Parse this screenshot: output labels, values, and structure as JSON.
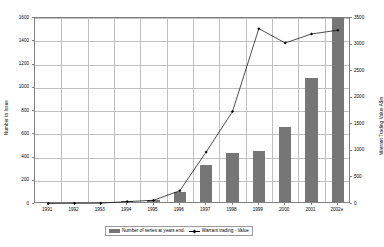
{
  "chart_data": {
    "type": "bar",
    "title": "",
    "subtitle": "",
    "xlabel": "",
    "ylabel": "Number in Issue",
    "y2label": "Warrant Trading Value A$m",
    "categories": [
      "1991",
      "1992",
      "1993",
      "1994",
      "1995",
      "1996",
      "1997",
      "1998",
      "1999",
      "2000",
      "2001",
      "2002e"
    ],
    "grid": true,
    "legend_position": "bottom",
    "ylim": [
      0,
      1600
    ],
    "y2lim": [
      0,
      3500
    ],
    "yticks": [
      "0",
      "200",
      "400",
      "600",
      "800",
      "1000",
      "1200",
      "1400",
      "1600"
    ],
    "y2ticks": [
      "0",
      "500",
      "1000",
      "1500",
      "2000",
      "2500",
      "3000",
      "3500"
    ],
    "series": [
      {
        "name": "Number of series  at years end.",
        "type": "bar",
        "axis": "left",
        "color": "#767676",
        "values": [
          2,
          2,
          3,
          8,
          18,
          85,
          315,
          420,
          435,
          645,
          1065,
          1590
        ]
      },
      {
        "name": "Warrant trading  - Value",
        "type": "line",
        "axis": "right",
        "color": "#000000",
        "marker": "diamond",
        "values": [
          10,
          12,
          15,
          45,
          70,
          250,
          980,
          1740,
          3300,
          3030,
          3200,
          3270
        ]
      }
    ]
  },
  "legend": {
    "items": [
      {
        "label": "Number of series  at years end.",
        "swatch": "bar-swatch"
      },
      {
        "label": "Warrant trading  - Value",
        "swatch": "line-marker-swatch"
      }
    ]
  },
  "axes": {
    "left_title": "Number in Issue",
    "right_title": "Warrant Trading Value A$m"
  }
}
